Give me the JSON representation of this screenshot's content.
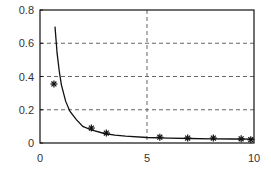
{
  "chart_data": {
    "type": "line",
    "title": "",
    "xlabel": "",
    "ylabel": "",
    "xlim": [
      0,
      10
    ],
    "ylim": [
      0,
      0.8
    ],
    "x_ticks": [
      "0",
      "5",
      "10"
    ],
    "y_ticks": [
      "0",
      "0.2",
      "0.4",
      "0.6",
      "0.8"
    ],
    "grid": {
      "horizontal": [
        0.2,
        0.4,
        0.6
      ],
      "vertical": [
        5
      ],
      "style": "dashed"
    },
    "legend": null,
    "series": [
      {
        "name": "fitted curve",
        "style": "solid line",
        "x": [
          0.7,
          0.8,
          0.9,
          1.0,
          1.2,
          1.4,
          1.7,
          2.0,
          2.4,
          3.0,
          3.5,
          4.0,
          5.0,
          6.0,
          7.0,
          8.0,
          9.0,
          10.0
        ],
        "values": [
          0.7,
          0.54,
          0.43,
          0.35,
          0.25,
          0.19,
          0.14,
          0.1,
          0.078,
          0.057,
          0.047,
          0.041,
          0.033,
          0.029,
          0.027,
          0.025,
          0.024,
          0.023
        ]
      },
      {
        "name": "measured",
        "style": "asterisk markers",
        "x": [
          0.65,
          2.4,
          3.1,
          5.6,
          6.9,
          8.1,
          9.4,
          9.85
        ],
        "values": [
          0.355,
          0.09,
          0.06,
          0.035,
          0.03,
          0.03,
          0.025,
          0.02
        ]
      }
    ]
  },
  "colors": {
    "line": "#111111",
    "grid": "#666666",
    "axis": "#111111",
    "text": "#333333"
  }
}
